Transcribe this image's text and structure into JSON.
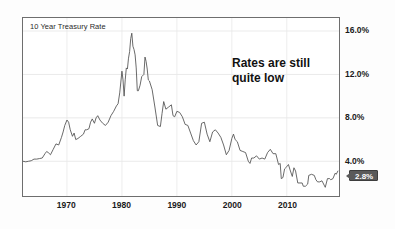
{
  "chart_data": {
    "type": "line",
    "title": "10 Year Treasury Rate",
    "xlabel": "",
    "ylabel": "",
    "xlim": [
      1962,
      2019.5
    ],
    "ylim": [
      0.8,
      17.2
    ],
    "grid": true,
    "legend": "none",
    "y_ticks": [
      "4.0%",
      "8.0%",
      "12.0%",
      "16.0%"
    ],
    "y_tick_values": [
      4.0,
      8.0,
      12.0,
      16.0
    ],
    "x_ticks": [
      "1970",
      "1980",
      "1990",
      "2000",
      "2010"
    ],
    "x_tick_values": [
      1970,
      1980,
      1990,
      2000,
      2010
    ],
    "annotations": [
      {
        "text_line1": "Rates are still",
        "text_line2": "quite low"
      }
    ],
    "last_value_label": "2.8%",
    "last_value": 2.8,
    "series_name": "10 Year Treasury Rate",
    "line_color": "#4d4d4d",
    "x": [
      1962.0,
      1962.5,
      1963.0,
      1963.5,
      1964.0,
      1964.5,
      1965.0,
      1965.5,
      1966.0,
      1966.3,
      1966.6,
      1967.0,
      1967.5,
      1968.0,
      1968.5,
      1969.0,
      1969.3,
      1969.6,
      1970.0,
      1970.3,
      1970.6,
      1971.0,
      1971.3,
      1971.6,
      1972.0,
      1972.5,
      1973.0,
      1973.3,
      1973.6,
      1974.0,
      1974.3,
      1974.6,
      1975.0,
      1975.3,
      1975.6,
      1976.0,
      1976.5,
      1977.0,
      1977.5,
      1978.0,
      1978.5,
      1979.0,
      1979.3,
      1979.6,
      1980.0,
      1980.2,
      1980.4,
      1980.6,
      1980.8,
      1981.0,
      1981.2,
      1981.4,
      1981.6,
      1981.8,
      1982.0,
      1982.2,
      1982.4,
      1982.6,
      1982.8,
      1983.0,
      1983.3,
      1983.6,
      1984.0,
      1984.2,
      1984.4,
      1984.6,
      1984.8,
      1985.0,
      1985.5,
      1986.0,
      1986.5,
      1987.0,
      1987.3,
      1987.6,
      1988.0,
      1988.5,
      1989.0,
      1989.3,
      1989.6,
      1990.0,
      1990.5,
      1991.0,
      1991.5,
      1992.0,
      1992.5,
      1993.0,
      1993.5,
      1994.0,
      1994.5,
      1995.0,
      1995.5,
      1996.0,
      1996.5,
      1997.0,
      1997.5,
      1998.0,
      1998.5,
      1999.0,
      1999.5,
      2000.0,
      2000.3,
      2000.6,
      2001.0,
      2001.5,
      2002.0,
      2002.5,
      2003.0,
      2003.3,
      2003.6,
      2004.0,
      2004.5,
      2005.0,
      2005.5,
      2006.0,
      2006.5,
      2007.0,
      2007.5,
      2008.0,
      2008.5,
      2008.8,
      2009.0,
      2009.3,
      2009.6,
      2010.0,
      2010.3,
      2010.6,
      2011.0,
      2011.3,
      2011.6,
      2012.0,
      2012.4,
      2012.8,
      2013.0,
      2013.4,
      2013.8,
      2014.0,
      2014.5,
      2015.0,
      2015.3,
      2015.6,
      2016.0,
      2016.4,
      2016.8,
      2017.0,
      2017.4,
      2017.8,
      2018.0,
      2018.4,
      2018.8,
      2019.0,
      2019.3
    ],
    "y": [
      4.0,
      3.95,
      4.0,
      4.05,
      4.2,
      4.2,
      4.25,
      4.3,
      4.7,
      4.9,
      4.8,
      4.6,
      5.1,
      5.6,
      5.5,
      6.2,
      6.7,
      7.3,
      7.8,
      7.6,
      6.9,
      6.3,
      6.6,
      6.0,
      6.1,
      6.3,
      6.5,
      6.9,
      6.9,
      7.0,
      7.6,
      7.9,
      7.5,
      8.0,
      8.2,
      7.8,
      7.5,
      7.3,
      7.6,
      8.2,
      8.6,
      9.1,
      9.3,
      10.3,
      12.3,
      11.5,
      10.0,
      11.5,
      12.6,
      12.5,
      13.5,
      14.1,
      15.3,
      15.8,
      14.6,
      14.3,
      13.8,
      12.6,
      10.5,
      10.5,
      11.0,
      11.8,
      12.0,
      13.6,
      13.2,
      12.5,
      11.5,
      11.4,
      10.6,
      9.0,
      7.3,
      7.2,
      8.4,
      9.5,
      8.8,
      9.0,
      9.2,
      8.2,
      8.1,
      8.6,
      8.5,
      8.1,
      7.4,
      7.3,
      6.6,
      5.9,
      5.5,
      5.8,
      7.5,
      7.6,
      6.5,
      5.8,
      6.7,
      6.9,
      6.6,
      6.2,
      5.5,
      4.6,
      5.0,
      6.1,
      6.5,
      6.0,
      5.8,
      5.0,
      4.9,
      4.8,
      4.0,
      3.8,
      4.3,
      4.3,
      4.5,
      4.2,
      4.3,
      4.2,
      4.8,
      5.1,
      4.7,
      4.7,
      3.7,
      3.8,
      2.4,
      2.5,
      3.3,
      3.5,
      3.7,
      3.2,
      2.6,
      3.4,
      3.1,
      2.0,
      2.0,
      2.0,
      1.7,
      1.7,
      1.9,
      2.7,
      2.8,
      2.7,
      2.3,
      2.1,
      2.1,
      2.2,
      1.8,
      1.6,
      2.4,
      2.4,
      2.3,
      2.4,
      2.9,
      2.8,
      3.1,
      2.9,
      2.7,
      2.6
    ]
  }
}
